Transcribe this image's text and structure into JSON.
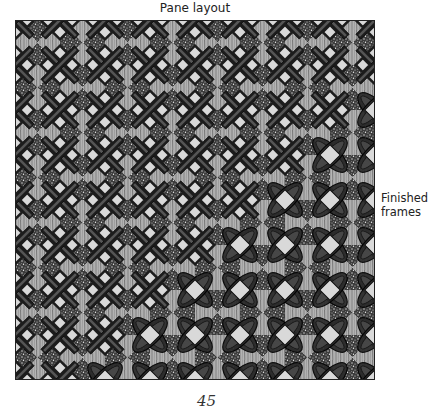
{
  "figure": {
    "title": "Pane layout",
    "side_label_line1": "Finished",
    "side_label_line2": "frames",
    "page_number": "45"
  },
  "pattern": {
    "grid_cols": 8,
    "grid_rows": 8,
    "tile_size": 45,
    "colors": {
      "frame_dark": "#1c1c1c",
      "frame_mid": "#555555",
      "petal_dark": "#2a2a2a",
      "petal_mid": "#4a4a4a",
      "pane_light": "#d9d9d9",
      "texture_gray": "#9a9a9a",
      "speckle_bg": "#3a3a3a",
      "speckle_fg": "#e0e0e0"
    }
  }
}
